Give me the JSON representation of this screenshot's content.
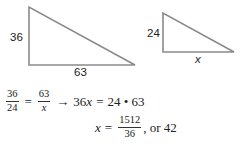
{
  "figure": {
    "large_triangle": {
      "vertical_side_label": "36",
      "horizontal_side_label": "63",
      "stroke_color": "#8a8a8a"
    },
    "small_triangle": {
      "vertical_side_label": "24",
      "horizontal_side_label": "x",
      "stroke_color": "#8a8a8a"
    }
  },
  "equations": {
    "line1": {
      "frac1_num": "36",
      "frac1_den": "24",
      "equals": "=",
      "frac2_num": "63",
      "frac2_den": "x",
      "arrow": "→",
      "lhs": "36",
      "lhs_var": "x",
      "equals2": "=",
      "rhs": "24 • 63"
    },
    "line2": {
      "var": "x",
      "equals": "=",
      "frac_num": "1512",
      "frac_den": "36",
      "suffix": ", or 42"
    }
  }
}
